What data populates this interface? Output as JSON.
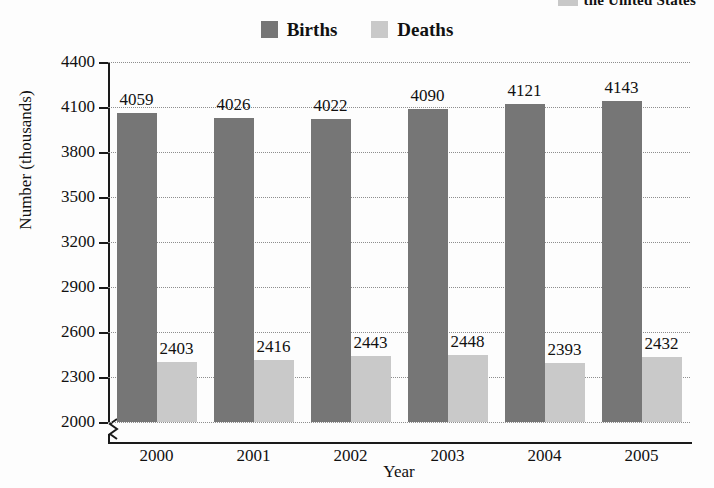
{
  "title_fragment": {
    "text": "the United States",
    "swatch_color": "#c8c8c8"
  },
  "legend": {
    "position": "top-center",
    "items": [
      {
        "label": "Births",
        "color": "#767676"
      },
      {
        "label": "Deaths",
        "color": "#c9c9c9"
      }
    ]
  },
  "axes": {
    "ylabel": "Number (thousands)",
    "xlabel": "Year",
    "yticks": [
      2000,
      2300,
      2600,
      2900,
      3200,
      3500,
      3800,
      4100,
      4400
    ],
    "axis_break": true
  },
  "chart_data": {
    "type": "bar",
    "title": "the United States",
    "xlabel": "Year",
    "ylabel": "Number (thousands)",
    "categories": [
      "2000",
      "2001",
      "2002",
      "2003",
      "2004",
      "2005"
    ],
    "series": [
      {
        "name": "Births",
        "color": "#767676",
        "values": [
          4059,
          4026,
          4022,
          4090,
          4121,
          4143
        ]
      },
      {
        "name": "Deaths",
        "color": "#c9c9c9",
        "values": [
          2403,
          2416,
          2443,
          2448,
          2393,
          2432
        ]
      }
    ],
    "ylim": [
      2000,
      4400
    ],
    "ytick_step": 300,
    "grid": true,
    "grid_style": "dotted-horizontal",
    "legend_position": "top-center",
    "data_labels": true
  }
}
